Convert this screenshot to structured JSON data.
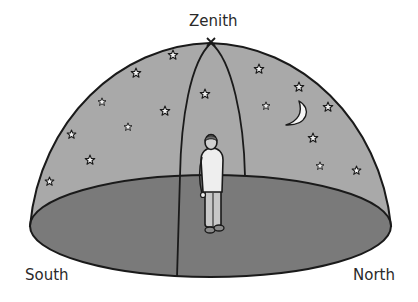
{
  "diagram": {
    "labels": {
      "zenith": "Zenith",
      "south": "South",
      "north": "North"
    },
    "zenith_marker": "x",
    "colors": {
      "sky_dome": "#a9a9a9",
      "ground_plane": "#7a7a7a",
      "outline": "#1a1a1a",
      "stars": "#f2f2f2",
      "moon": "#f5f5f5",
      "background": "#ffffff"
    },
    "elements": {
      "observer": "person standing at center of horizon plane",
      "moon": "crescent moon",
      "meridian": "arc from south through zenith to north",
      "star_count": 20
    }
  }
}
